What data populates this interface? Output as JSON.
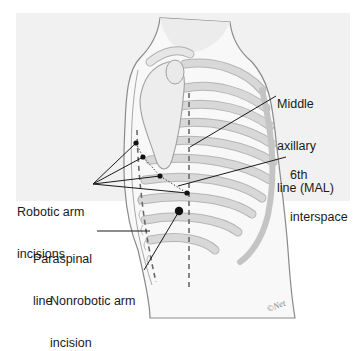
{
  "figure": {
    "colors": {
      "page_background": "#ffffff",
      "panel_background": "#f1f1f1",
      "body_fill": "#f7f7f7",
      "outline": "#8a8a8a",
      "rib": "#d4d4d4",
      "rib_edge": "#b5b5b5",
      "scapula": "#ededed",
      "leader_line": "#1a1a1a",
      "dashed_line": "#6a6a6a",
      "incision_dot": "#111111"
    }
  },
  "labels": {
    "mal": {
      "line1": "Middle",
      "line2": "axillary",
      "line3": "line (MAL)"
    },
    "interspace": {
      "line1": "6th",
      "line2": "interspace"
    },
    "robotic": {
      "line1": "Robotic arm",
      "line2": "incisions"
    },
    "paraspinal": {
      "line1": "Paraspinal",
      "line2": "line"
    },
    "nonrobotic": {
      "line1": "Nonrobotic arm",
      "line2": "incision"
    },
    "signature": "©Net"
  },
  "markers": {
    "robotic_incisions": [
      {
        "x": 136,
        "y": 143
      },
      {
        "x": 143,
        "y": 157
      },
      {
        "x": 160,
        "y": 176
      },
      {
        "x": 187,
        "y": 193
      }
    ],
    "nonrobotic_incision": {
      "x": 179,
      "y": 211
    }
  }
}
